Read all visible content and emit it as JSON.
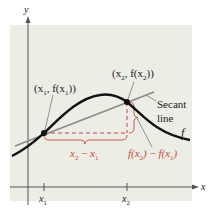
{
  "diagram": {
    "axes": {
      "x_label": "x",
      "y_label": "y"
    },
    "ticks": {
      "x1": {
        "main": "x",
        "sub": "1"
      },
      "x2": {
        "main": "x",
        "sub": "2"
      }
    },
    "points": {
      "p1": {
        "label_pre": "(x",
        "sub1": "1",
        "mid": ", f(x",
        "sub2": "1",
        "post": "))"
      },
      "p2": {
        "label_pre": "(x",
        "sub1": "2",
        "mid": ", f(x",
        "sub2": "2",
        "post": "))"
      }
    },
    "secant_label": {
      "line1": "Secant",
      "line2": "line"
    },
    "curve_label": "f",
    "run_label": {
      "a": "x",
      "a_sub": "2",
      "op": " − ",
      "b": "x",
      "b_sub": "1"
    },
    "rise_label": {
      "a": "f(x",
      "a_sub": "2",
      "a_post": ")",
      "op": " − ",
      "b": "f(x",
      "b_sub": "1",
      "b_post": ")"
    },
    "colors": {
      "background": "#eceee6",
      "curve": "#111111",
      "secant": "#8a8a8a",
      "accent_red": "#c8463c",
      "axis": "#555555"
    }
  }
}
